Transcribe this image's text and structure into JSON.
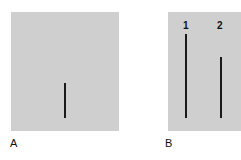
{
  "panels": [
    {
      "label": "A",
      "lines": [
        {
          "height_px": 35
        }
      ]
    },
    {
      "label": "B",
      "lines": [
        {
          "label": "1",
          "height_px": 84
        },
        {
          "label": "2",
          "height_px": 61
        }
      ]
    }
  ],
  "colors": {
    "panel_bg": "#cfcfcf",
    "line": "#1a1a1a"
  }
}
